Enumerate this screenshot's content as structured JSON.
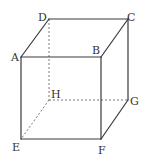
{
  "diagram": {
    "type": "cube-perspective",
    "vertices": [
      "A",
      "B",
      "C",
      "D",
      "E",
      "F",
      "G",
      "H"
    ],
    "labels": {
      "A": "A",
      "B": "B",
      "C": "C",
      "D": "D",
      "E": "E",
      "F": "F",
      "G": "G",
      "H": "H"
    },
    "visible_edges": [
      [
        "A",
        "B"
      ],
      [
        "B",
        "C"
      ],
      [
        "C",
        "D"
      ],
      [
        "D",
        "A"
      ],
      [
        "A",
        "E"
      ],
      [
        "B",
        "F"
      ],
      [
        "C",
        "G"
      ],
      [
        "E",
        "F"
      ],
      [
        "F",
        "G"
      ]
    ],
    "hidden_edges": [
      [
        "D",
        "H"
      ],
      [
        "H",
        "E"
      ],
      [
        "H",
        "G"
      ]
    ],
    "colors": {
      "edge": "#3a3a3a",
      "hidden_edge": "#6a6a6a",
      "label": "#333333",
      "background": "#ffffff"
    }
  }
}
